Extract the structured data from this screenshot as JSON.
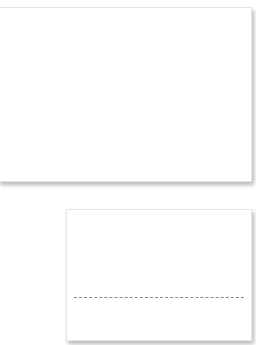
{
  "cards": [
    {
      "id": "top",
      "content": ""
    },
    {
      "id": "bottom",
      "content": "",
      "divider": {
        "style": "dashed",
        "color": "#8a8a8a"
      }
    }
  ],
  "colors": {
    "background": "#ffffff",
    "card": "#ffffff",
    "divider": "#8a8a8a"
  }
}
